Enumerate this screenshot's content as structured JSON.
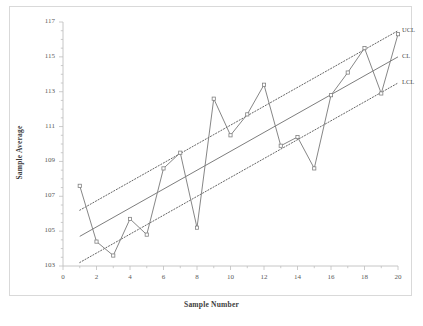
{
  "chart_data": {
    "type": "line",
    "title": "",
    "xlabel": "Sample Number",
    "ylabel": "Sample Average",
    "xlim": [
      0,
      20
    ],
    "ylim": [
      103,
      117
    ],
    "xticks": [
      0,
      2,
      4,
      6,
      8,
      10,
      12,
      14,
      16,
      18,
      20
    ],
    "yticks": [
      103,
      105,
      107,
      109,
      111,
      113,
      115,
      117
    ],
    "grid": false,
    "legend_position": "right-inline",
    "categories": [
      1,
      2,
      3,
      4,
      5,
      6,
      7,
      8,
      9,
      10,
      11,
      12,
      13,
      14,
      15,
      16,
      17,
      18,
      19,
      20
    ],
    "series": [
      {
        "name": "Sample Average",
        "marker": "square",
        "style": "solid",
        "color": "#808080",
        "values": [
          107.6,
          104.4,
          103.6,
          105.7,
          104.8,
          108.6,
          109.5,
          105.2,
          112.6,
          110.5,
          111.7,
          113.4,
          109.9,
          110.4,
          108.6,
          112.8,
          114.1,
          115.5,
          112.9,
          116.3
        ]
      },
      {
        "name": "UCL",
        "style": "dotted",
        "color": "#555555",
        "endpoints": {
          "x0": 1,
          "y0": 106.2,
          "x1": 20,
          "y1": 116.5
        }
      },
      {
        "name": "CL",
        "style": "solid",
        "color": "#6e6e6e",
        "endpoints": {
          "x0": 1,
          "y0": 104.7,
          "x1": 20,
          "y1": 115.0
        }
      },
      {
        "name": "LCL",
        "style": "dotted",
        "color": "#555555",
        "endpoints": {
          "x0": 1,
          "y0": 103.2,
          "x1": 20,
          "y1": 113.5
        }
      }
    ],
    "annotations": [
      {
        "text": "UCL",
        "x": 20,
        "y": 116.5
      },
      {
        "text": "CL",
        "x": 20,
        "y": 115.0
      },
      {
        "text": "LCL",
        "x": 20,
        "y": 113.5
      }
    ]
  },
  "colors": {
    "series_line": "#808080",
    "control_limit": "#555555",
    "center_line": "#6e6e6e",
    "axis": "#bfbfbf",
    "text": "#4a4a4a",
    "frame": "#d9d9d9",
    "background": "#ffffff"
  }
}
